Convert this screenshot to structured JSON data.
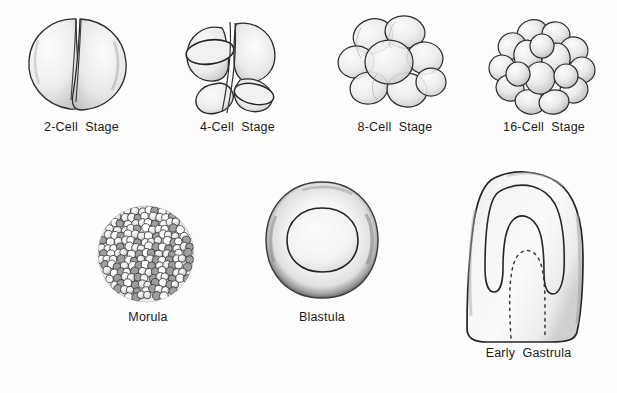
{
  "figure": {
    "background_color": "#fdfdfd",
    "ink_color": "#1a1a1a",
    "style": "hand-drawn pencil illustration"
  },
  "stages": [
    {
      "id": "two-cell",
      "label": "2-Cell  Stage",
      "cell_count": 2,
      "row": 1,
      "column": 1,
      "description": "Two rounded blastomeres separated by a vertical cleavage furrow"
    },
    {
      "id": "four-cell",
      "label": "4-Cell  Stage",
      "cell_count": 4,
      "row": 1,
      "column": 2,
      "description": "Four wedge-shaped blastomeres arranged in quadrants"
    },
    {
      "id": "eight-cell",
      "label": "8-Cell  Stage",
      "cell_count": 8,
      "row": 1,
      "column": 3,
      "description": "Eight overlapping spherical blastomeres"
    },
    {
      "id": "sixteen-cell",
      "label": "16-Cell  Stage",
      "cell_count": 16,
      "row": 1,
      "column": 4,
      "description": "Sixteen tightly packed rounded blastomeres"
    },
    {
      "id": "morula",
      "label": "Morula",
      "cell_count": null,
      "row": 2,
      "column": 1,
      "description": "Solid ball of many small granular cells"
    },
    {
      "id": "blastula",
      "label": "Blastula",
      "cell_count": null,
      "row": 2,
      "column": 2,
      "description": "Hollow sphere with thick cell layer surrounding a central blastocoel"
    },
    {
      "id": "early-gastrula",
      "label": "Early  Gastrula",
      "cell_count": null,
      "row": 2,
      "column": 3,
      "description": "Sectioned embryo showing invagination forming the archenteron, marked by a dotted outline"
    }
  ]
}
